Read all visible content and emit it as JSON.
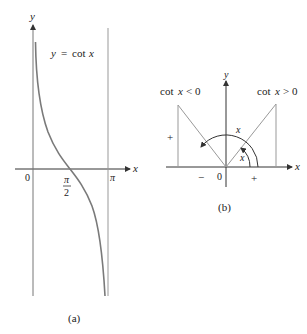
{
  "panel_a": {
    "caption": "(a)",
    "equation_lhs": "y",
    "equation_eq": "=",
    "equation_rhs_fn": "cot",
    "equation_rhs_var": "x",
    "axis_x_label": "x",
    "axis_y_label": "y",
    "tick_origin": "0",
    "tick_half_pi_num": "π",
    "tick_half_pi_den": "2",
    "tick_pi": "π"
  },
  "panel_b": {
    "caption": "(b)",
    "axis_x_label": "x",
    "axis_y_label": "y",
    "origin_label": "0",
    "left_label_fn": "cot",
    "left_label_var": "x",
    "left_label_rel": "< 0",
    "right_label_fn": "cot",
    "right_label_var": "x",
    "right_label_rel": "> 0",
    "left_vertical_sign": "+",
    "left_horizontal_sign": "−",
    "right_horizontal_sign": "+",
    "big_angle_label": "x",
    "small_angle_label": "x"
  },
  "colors": {
    "axis": "#333333",
    "curve": "#7a7a7a",
    "line": "#9a9a9a"
  }
}
